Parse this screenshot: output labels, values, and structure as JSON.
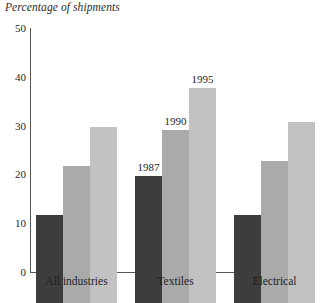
{
  "chart_data": {
    "type": "bar",
    "title": "Percentage of shipments",
    "xlabel": "",
    "ylabel": "",
    "ylim": [
      0,
      50
    ],
    "ytick_values": [
      0,
      10,
      20,
      30,
      40,
      50
    ],
    "ytick_labels": [
      "0",
      "10",
      "20",
      "30",
      "40",
      "50"
    ],
    "grid": false,
    "legend_position": "inline-annotations",
    "categories": [
      "All industries",
      "Textiles",
      "Electrical"
    ],
    "series": [
      {
        "name": "1987",
        "values": [
          18,
          26,
          18
        ],
        "color": "#3d3d3d"
      },
      {
        "name": "1990",
        "values": [
          28,
          35.5,
          29
        ],
        "color": "#aaaaaa"
      },
      {
        "name": "1995",
        "values": [
          36,
          44,
          37
        ],
        "color": "#c2c2c2"
      }
    ],
    "annotations": [
      {
        "text": "1987",
        "series": "1987",
        "category": "Textiles"
      },
      {
        "text": "1990",
        "series": "1990",
        "category": "Textiles"
      },
      {
        "text": "1995",
        "series": "1995",
        "category": "Textiles"
      }
    ]
  }
}
